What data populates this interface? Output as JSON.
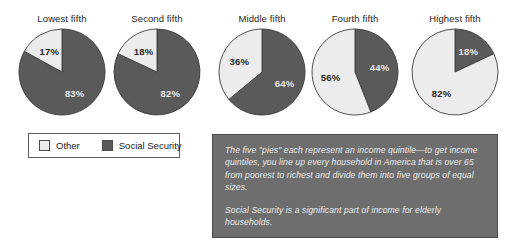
{
  "colors": {
    "social_security": "#5a5a5a",
    "other": "#ececec",
    "outline": "#3c3c3c",
    "note_box_background": "#6e6e6e",
    "note_text": "#eaeaea",
    "page_background": "#ffffff"
  },
  "legend": {
    "items": [
      {
        "label": "Other",
        "color": "#ececec",
        "series": "other"
      },
      {
        "label": "Social Security",
        "color": "#5a5a5a",
        "series": "social_security"
      }
    ]
  },
  "note": {
    "paragraph_1": "The five \"pies\" each represent an income quintile—to get income quintiles, you line up every household in America that is over 65 from poorest to richest and divide them into five groups of equal sizes.",
    "paragraph_2": "Social Security is a significant part of income for elderly households."
  },
  "chart_data": {
    "type": "pie",
    "title": "",
    "legend_position": "bottom-left",
    "legend_entries": [
      "Other",
      "Social Security"
    ],
    "series_names": [
      "Other",
      "Social Security"
    ],
    "value_suffix": "%",
    "charts": [
      {
        "title": "Lowest fifth",
        "slices": [
          {
            "name": "Other",
            "value": 17,
            "label": "17%",
            "color": "#ececec",
            "label_on": "light"
          },
          {
            "name": "Social Security",
            "value": 83,
            "label": "83%",
            "color": "#5a5a5a",
            "label_on": "dark"
          }
        ]
      },
      {
        "title": "Second fifth",
        "slices": [
          {
            "name": "Other",
            "value": 18,
            "label": "18%",
            "color": "#ececec",
            "label_on": "light"
          },
          {
            "name": "Social Security",
            "value": 82,
            "label": "82%",
            "color": "#5a5a5a",
            "label_on": "dark"
          }
        ]
      },
      {
        "title": "Middle fifth",
        "slices": [
          {
            "name": "Other",
            "value": 36,
            "label": "36%",
            "color": "#ececec",
            "label_on": "light"
          },
          {
            "name": "Social Security",
            "value": 64,
            "label": "64%",
            "color": "#5a5a5a",
            "label_on": "dark"
          }
        ]
      },
      {
        "title": "Fourth fifth",
        "slices": [
          {
            "name": "Other",
            "value": 56,
            "label": "56%",
            "color": "#ececec",
            "label_on": "light"
          },
          {
            "name": "Social Security",
            "value": 44,
            "label": "44%",
            "color": "#5a5a5a",
            "label_on": "dark"
          }
        ]
      },
      {
        "title": "Highest fifth",
        "slices": [
          {
            "name": "Other",
            "value": 82,
            "label": "82%",
            "color": "#ececec",
            "label_on": "light"
          },
          {
            "name": "Social Security",
            "value": 18,
            "label": "18%",
            "color": "#5a5a5a",
            "label_on": "dark"
          }
        ]
      }
    ],
    "layout": {
      "pie_centers_x": [
        62,
        157,
        262,
        355,
        455
      ],
      "pie_center_y": 72,
      "pie_radius": 43
    }
  }
}
